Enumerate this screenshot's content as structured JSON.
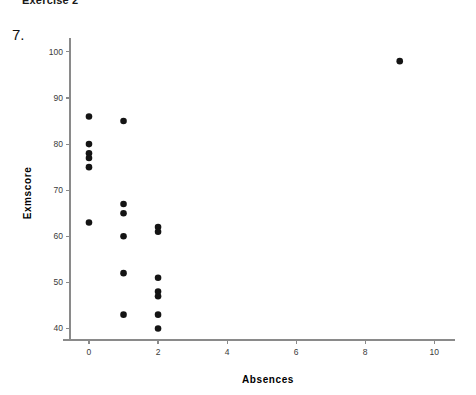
{
  "page": {
    "header": "Exercise 2",
    "question_number": "7."
  },
  "chart_data": {
    "type": "scatter",
    "title": "",
    "xlabel": "Absences",
    "ylabel": "Exmscore",
    "xlim": [
      -0.55,
      10.6
    ],
    "ylim": [
      37.5,
      101.5
    ],
    "grid": false,
    "legend": false,
    "xticks": [
      0,
      2,
      4,
      6,
      8,
      10
    ],
    "xticklabels": [
      "0",
      "2",
      "4",
      "6",
      "8",
      "10"
    ],
    "yticks": [
      40,
      50,
      60,
      70,
      80,
      90,
      100
    ],
    "yticklabels": [
      "40",
      "50",
      "60",
      "70",
      "80",
      "90",
      "100"
    ],
    "marker": "filled-circle",
    "marker_color": "#141414",
    "marker_size_px": 4.6,
    "points": [
      {
        "x": 0,
        "y": 86
      },
      {
        "x": 0,
        "y": 80
      },
      {
        "x": 0,
        "y": 78
      },
      {
        "x": 0,
        "y": 77
      },
      {
        "x": 0,
        "y": 75
      },
      {
        "x": 0,
        "y": 63
      },
      {
        "x": 1,
        "y": 85
      },
      {
        "x": 1,
        "y": 67
      },
      {
        "x": 1,
        "y": 65
      },
      {
        "x": 1,
        "y": 60
      },
      {
        "x": 1,
        "y": 52
      },
      {
        "x": 1,
        "y": 43
      },
      {
        "x": 2,
        "y": 62
      },
      {
        "x": 2,
        "y": 61
      },
      {
        "x": 2,
        "y": 51
      },
      {
        "x": 2,
        "y": 48
      },
      {
        "x": 2,
        "y": 47
      },
      {
        "x": 2,
        "y": 43
      },
      {
        "x": 2,
        "y": 40
      },
      {
        "x": 9,
        "y": 98
      }
    ]
  }
}
